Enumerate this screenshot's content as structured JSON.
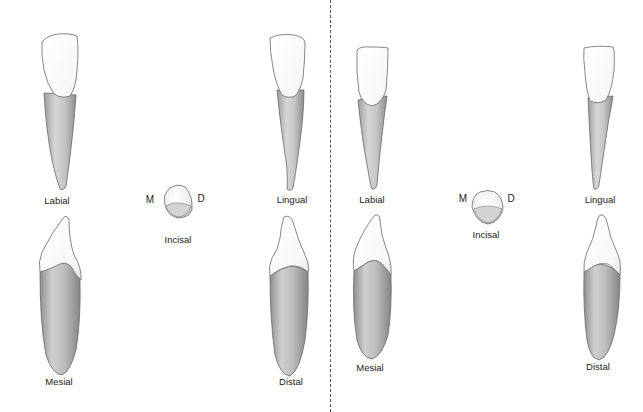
{
  "figure": {
    "type": "dental anatomy illustration",
    "panels": [
      {
        "side": "left",
        "views": {
          "labial": {
            "label": "Labial"
          },
          "lingual": {
            "label": "Lingual"
          },
          "mesial": {
            "label": "Mesial"
          },
          "distal": {
            "label": "Distal"
          },
          "incisal": {
            "label": "Incisal",
            "mesial_marker": "M",
            "distal_marker": "D"
          }
        }
      },
      {
        "side": "right",
        "views": {
          "labial": {
            "label": "Labial"
          },
          "lingual": {
            "label": "Lingual"
          },
          "mesial": {
            "label": "Mesial"
          },
          "distal": {
            "label": "Distal"
          },
          "incisal": {
            "label": "Incisal",
            "mesial_marker": "M",
            "distal_marker": "D"
          }
        }
      }
    ],
    "colors": {
      "background": "#ffffff",
      "crown": "#fbfbfb",
      "root": "#c9c9c9",
      "outline": "#6a6a6a",
      "label_text": "#222222",
      "divider": "#555555"
    }
  }
}
